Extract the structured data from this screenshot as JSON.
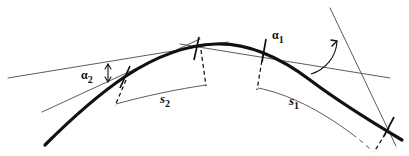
{
  "figure": {
    "background": "#ffffff",
    "width": 409,
    "height": 156,
    "ink_color": "#111111",
    "thin_color": "#4a4a4a",
    "labels": {
      "alpha1": {
        "base": "α",
        "sub": "1"
      },
      "alpha2": {
        "base": "α",
        "sub": "2"
      },
      "s1": {
        "base": "s",
        "sub": "1"
      },
      "s2": {
        "base": "s",
        "sub": "2"
      }
    }
  },
  "geometry": {
    "main_curve": {
      "name": "thick-arc",
      "stroke_width": 3.2,
      "path": "M 45 145 C 70 120 96 96 126 76 C 158 55 186 45 216 44 C 248 43 278 56 310 80 C 338 101 370 121 402 140"
    },
    "tangent_lines": [
      {
        "name": "tangent-left-upper",
        "x1": 8,
        "y1": 78,
        "x2": 228,
        "y2": 42
      },
      {
        "name": "tangent-left-lower",
        "x1": 42,
        "y1": 112,
        "x2": 200,
        "y2": 39
      },
      {
        "name": "tangent-apex",
        "x1": 180,
        "y1": 44,
        "x2": 390,
        "y2": 78
      },
      {
        "name": "tangent-right-steep",
        "x1": 330,
        "y1": 8,
        "x2": 396,
        "y2": 146
      }
    ],
    "ticks": [
      {
        "name": "tick-left",
        "x1": 120,
        "y1": 88,
        "x2": 130,
        "y2": 66
      },
      {
        "name": "tick-mid-left",
        "x1": 194,
        "y1": 60,
        "x2": 199,
        "y2": 37
      },
      {
        "name": "tick-mid-right",
        "x1": 262,
        "y1": 62,
        "x2": 266,
        "y2": 39
      },
      {
        "name": "tick-right",
        "x1": 384,
        "y1": 136,
        "x2": 394,
        "y2": 117
      }
    ],
    "dashed_ticks": [
      {
        "name": "dash-s2-left",
        "x1": 126,
        "y1": 80,
        "x2": 115,
        "y2": 104
      },
      {
        "name": "dash-s2-right",
        "x1": 201,
        "y1": 52,
        "x2": 205,
        "y2": 84
      },
      {
        "name": "dash-s1-left",
        "x1": 263,
        "y1": 56,
        "x2": 258,
        "y2": 88
      },
      {
        "name": "dash-s1-right",
        "x1": 389,
        "y1": 128,
        "x2": 374,
        "y2": 150
      }
    ],
    "measure_arcs": [
      {
        "name": "arc-s2",
        "path": "M 116 104 C 145 96 178 89 206 85"
      },
      {
        "name": "arc-s1",
        "path": "M 258 88 C 290 95 330 115 372 150",
        "dashed_tail": true
      }
    ],
    "angle_marks": [
      {
        "name": "angle-alpha1-arc",
        "path": "M 312 73 A 34 34 0 0 0 340 42"
      },
      {
        "name": "angle-alpha2-arrow",
        "x": 108,
        "y1": 64,
        "y2": 82
      }
    ]
  }
}
